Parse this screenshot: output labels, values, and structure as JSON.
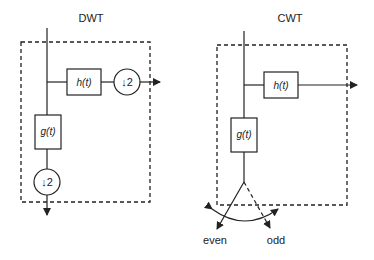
{
  "diagrams": {
    "dwt": {
      "title": "DWT",
      "highpass_label": "h(t)",
      "lowpass_label": "g(t)",
      "downsample_high": "↓2",
      "downsample_low": "↓2"
    },
    "cwt": {
      "title": "CWT",
      "highpass_label": "h(t)",
      "lowpass_label": "g(t)",
      "branch_even": "even",
      "branch_odd": "odd"
    }
  },
  "colors": {
    "stroke": "#222222",
    "background": "#ffffff"
  }
}
